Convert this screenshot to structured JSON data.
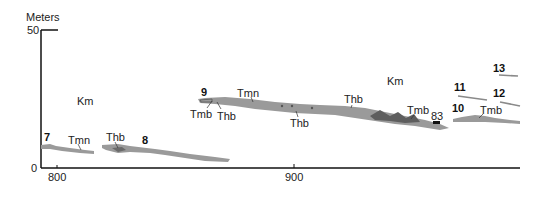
{
  "axes": {
    "y_label": "Meters",
    "y_ticks": [
      "50",
      "0"
    ],
    "x_ticks": [
      "800",
      "900"
    ]
  },
  "formations": {
    "km_left": "Km",
    "km_right": "Km"
  },
  "section_numbers": [
    "7",
    "8",
    "9",
    "10",
    "11",
    "12",
    "13"
  ],
  "unit_labels": {
    "tmn_7": "Tmn",
    "thb_8": "Thb",
    "tmb_9": "Tmb",
    "thb_9": "Thb",
    "tmn_9": "Tmn",
    "thb_mid": "Thb",
    "thb_upper": "Thb",
    "tmb_right": "Tmb",
    "sample_83": "83",
    "tmb_10": "Tmb"
  },
  "colors": {
    "unit_fill": "#9a9a9a",
    "unit_dark": "#5e5e5e",
    "axis": "#111111"
  }
}
